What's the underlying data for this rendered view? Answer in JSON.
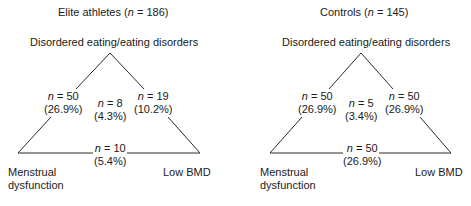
{
  "panels": [
    {
      "title": "Elite athletes",
      "title_n": "186",
      "vertices": {
        "top": "Disordered eating/eating disorders",
        "bottom_left_line1": "Menstrual",
        "bottom_left_line2": "dysfunction",
        "bottom_right": "Low BMD"
      },
      "edges": {
        "left": {
          "n": "50",
          "pct": "(26.9%)"
        },
        "right": {
          "n": "19",
          "pct": "(10.2%)"
        },
        "bottom": {
          "n": "10",
          "pct": "(5.4%)"
        }
      },
      "center": {
        "n": "8",
        "pct": "(4.3%)"
      }
    },
    {
      "title": "Controls",
      "title_n": "145",
      "vertices": {
        "top": "Disordered eating/eating disorders",
        "bottom_left_line1": "Menstrual",
        "bottom_left_line2": "dysfunction",
        "bottom_right": "Low BMD"
      },
      "edges": {
        "left": {
          "n": "50",
          "pct": "(26.9%)"
        },
        "right": {
          "n": "50",
          "pct": "(26.9%)"
        },
        "bottom": {
          "n": "50",
          "pct": "(26.9%)"
        }
      },
      "center": {
        "n": "5",
        "pct": "(3.4%)"
      }
    }
  ],
  "labels": {
    "n_symbol": "n",
    "equals": " = ",
    "open_paren": " (",
    "close_paren": ")"
  }
}
